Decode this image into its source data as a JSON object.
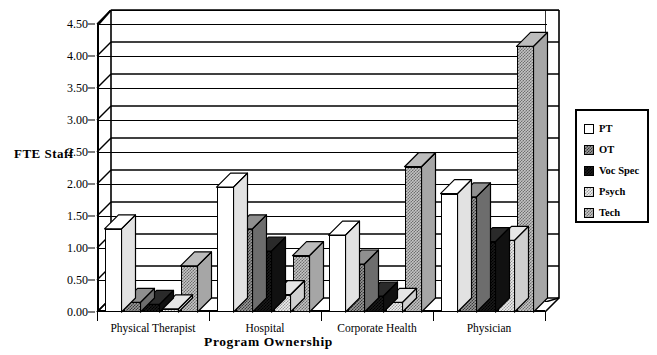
{
  "chart_data": {
    "type": "bar",
    "title": "",
    "xlabel": "Program Ownership",
    "ylabel": "FTE Staff",
    "categories": [
      "Physical Therapist",
      "Hospital",
      "Corporate Health",
      "Physician"
    ],
    "series": [
      {
        "name": "PT",
        "values": [
          1.3,
          1.95,
          1.2,
          1.85
        ]
      },
      {
        "name": "OT",
        "values": [
          0.15,
          1.3,
          0.75,
          1.8
        ]
      },
      {
        "name": "Voc Spec",
        "values": [
          0.12,
          0.95,
          0.25,
          1.1
        ]
      },
      {
        "name": "Psych",
        "values": [
          0.05,
          0.27,
          0.15,
          1.12
        ]
      },
      {
        "name": "Tech",
        "values": [
          0.72,
          0.88,
          2.27,
          4.15
        ]
      }
    ],
    "ylim": [
      0.0,
      4.5
    ],
    "ytick_labels": [
      "0.00",
      "0.50",
      "1.00",
      "1.50",
      "2.00",
      "2.50",
      "3.00",
      "3.50",
      "4.00",
      "4.50"
    ],
    "ytick_values": [
      0.0,
      0.5,
      1.0,
      1.5,
      2.0,
      2.5,
      3.0,
      3.5,
      4.0,
      4.5
    ],
    "grid": true,
    "legend_position": "right",
    "style": "3d-column",
    "colors": {
      "PT": "#ffffff",
      "OT": "#9a9a9a",
      "Voc Spec": "#1a1a1a",
      "Psych": "#ececec",
      "Tech": "#c4c4c4",
      "axis": "#000000",
      "background": "#ffffff"
    }
  },
  "legend": {
    "items": [
      {
        "label": "PT",
        "fill": "fill-pt"
      },
      {
        "label": "OT",
        "fill": "fill-ot"
      },
      {
        "label": "Voc Spec",
        "fill": "fill-voc"
      },
      {
        "label": "Psych",
        "fill": "fill-psych"
      },
      {
        "label": "Tech",
        "fill": "fill-tech"
      }
    ]
  }
}
